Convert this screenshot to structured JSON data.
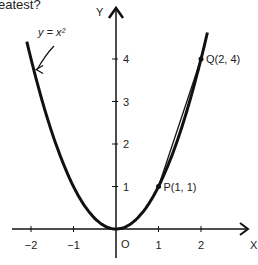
{
  "header_fragment": "eatest?",
  "chart_data": {
    "type": "line",
    "title": "",
    "xlabel": "X",
    "ylabel": "Y",
    "xlim": [
      -2.3,
      3
    ],
    "ylim": [
      -0.5,
      5.2
    ],
    "x_ticks": [
      -2,
      -1,
      1,
      2
    ],
    "x_tick_labels": [
      "−2",
      "−1",
      "1",
      "2"
    ],
    "y_ticks": [
      1,
      2,
      3,
      4
    ],
    "y_tick_labels": [
      "1",
      "2",
      "3",
      "4"
    ],
    "origin_label": "O",
    "grid": false,
    "series": [
      {
        "name": "y = x²",
        "function": "x^2",
        "x_range": [
          -2.1,
          2.15
        ]
      },
      {
        "name": "chord PQ",
        "points": [
          [
            1,
            1
          ],
          [
            2,
            4
          ]
        ]
      }
    ],
    "points": [
      {
        "label": "P(1, 1)",
        "x": 1,
        "y": 1
      },
      {
        "label": "Q(2, 4)",
        "x": 2,
        "y": 4
      }
    ],
    "annotations": [
      {
        "text": "y = x²",
        "points_to": [
          -1.95,
          3.8
        ]
      }
    ]
  }
}
